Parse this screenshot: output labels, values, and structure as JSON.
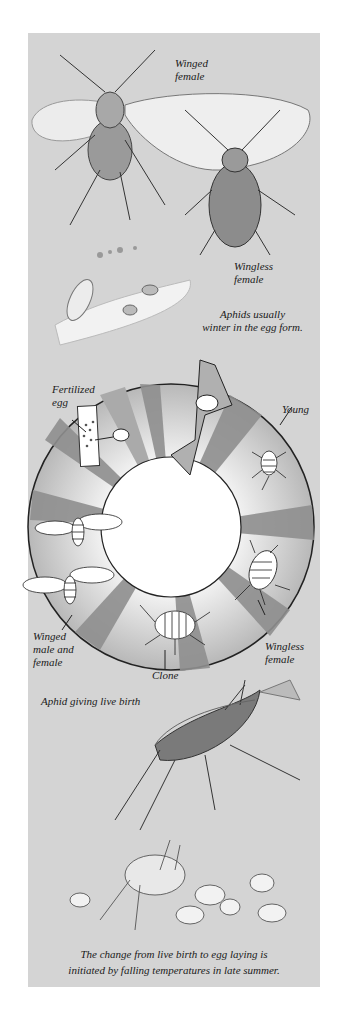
{
  "figure": {
    "labels": {
      "winged_female": "Winged\nfemale",
      "wingless_female_top": "Wingless\nfemale",
      "winter_note": "Aphids usually\nwinter in the egg form.",
      "fertilized_egg": "Fertilized\negg",
      "young": "Young",
      "wingless_female_cycle": "Wingless\nfemale",
      "clone": "Clone",
      "winged_male_female": "Winged\nmale and\nfemale",
      "live_birth": "Aphid giving live birth",
      "caption": "The change from live birth to egg laying is\ninitiated by falling temperatures in late summer."
    },
    "cycle_stages": [
      "Fertilized egg",
      "Young",
      "Wingless female",
      "Clone",
      "Winged male and female"
    ],
    "colors": {
      "background": "#d4d4d4",
      "ring_light": "#c9c9c9",
      "ring_dark": "#8f8f8f",
      "ring_outline": "#222222",
      "center": "#ffffff"
    }
  }
}
